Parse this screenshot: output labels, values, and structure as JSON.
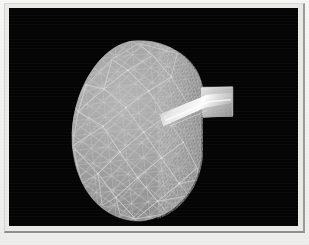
{
  "figure": {
    "domain": "3d-mesh-visualization",
    "title": "",
    "caption": "",
    "canvas_background_color": "#040404",
    "page_background_color": "#f2f2f1",
    "frame_color": "#d4d4d4",
    "frame_shadow_color": "#909090"
  },
  "render": {
    "object_name": "triangulated-ellipsoid-mesh",
    "description": "Shaded triangulated surface mesh of a rounded ovoid body with a rectangular protruding spout on the right side",
    "render_mode": "shaded-wireframe",
    "surface_fill_color": "#9b9b9b",
    "surface_shadow_color": "#6e6e6e",
    "wireframe_color": "#c8c8c8",
    "highlight_color": "#efefef",
    "specular_band_color": "#f6f6f6",
    "silhouette": {
      "center_x": 137,
      "center_y": 128,
      "radius_x": 66,
      "radius_y": 91
    },
    "protrusion": {
      "name": "spout",
      "x": 193,
      "y": 83,
      "width": 39,
      "height": 30
    },
    "mesh_regions": [
      {
        "name": "coarse-front-face",
        "triangle_density": "low",
        "shading": "lit"
      },
      {
        "name": "fine-right-flank",
        "triangle_density": "high",
        "shading": "shadowed"
      },
      {
        "name": "specular-highlight-band",
        "triangle_density": "high",
        "shading": "bright"
      }
    ],
    "lighting": {
      "key_light_direction": "upper-left",
      "specular_highlight_position": "right-flank-mid"
    }
  }
}
